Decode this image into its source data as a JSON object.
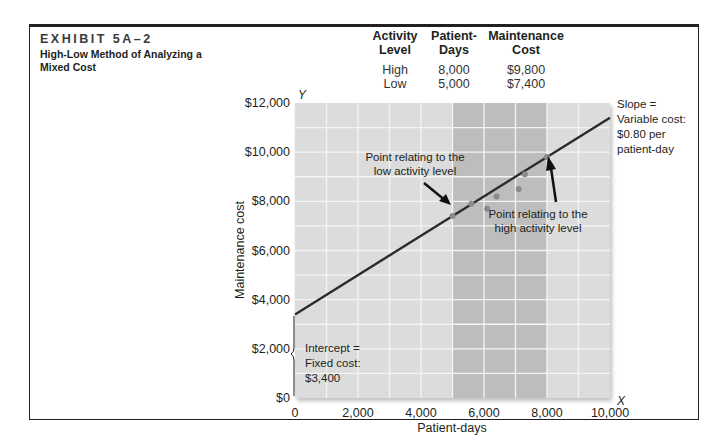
{
  "exhibit": {
    "number": "EXHIBIT 5A–2",
    "title": "High-Low Method of Analyzing a Mixed Cost"
  },
  "table": {
    "headers": [
      {
        "line1": "Activity",
        "line2": "Level"
      },
      {
        "line1": "Patient-",
        "line2": "Days"
      },
      {
        "line1": "Maintenance",
        "line2": "Cost"
      }
    ],
    "rows": [
      {
        "level": "High",
        "days": "8,000",
        "cost": "$9,800"
      },
      {
        "level": "Low",
        "days": "5,000",
        "cost": "$7,400"
      }
    ]
  },
  "annotations": {
    "low_point": "Point relating to the low activity level",
    "low_point_l1": "Point relating to the",
    "low_point_l2": "low activity level",
    "high_point_l1": "Point relating to the",
    "high_point_l2": "high activity level",
    "slope_l1": "Slope =",
    "slope_l2": "Variable cost:",
    "slope_l3": "$0.80 per",
    "slope_l4": "patient-day",
    "intercept_l1": "Intercept =",
    "intercept_l2": "Fixed cost:",
    "intercept_l3": "$3,400"
  },
  "chart_data": {
    "type": "scatter",
    "title": "High-Low Method of Analyzing a Mixed Cost",
    "xlabel": "Patient-days",
    "ylabel": "Maintenance cost",
    "x_axis_letter": "X",
    "y_axis_letter": "Y",
    "xlim": [
      0,
      10000
    ],
    "ylim": [
      0,
      12000
    ],
    "x_ticks": [
      "0",
      "2,000",
      "4,000",
      "6,000",
      "8,000",
      "10,000"
    ],
    "y_ticks": [
      "$0",
      "$2,000",
      "$4,000",
      "$6,000",
      "$8,000",
      "$10,000",
      "$12,000"
    ],
    "grid": true,
    "highlight_band": {
      "x_from": 5000,
      "x_to": 8000
    },
    "series": [
      {
        "name": "Observed maintenance cost",
        "type": "scatter",
        "points": [
          {
            "x": 5000,
            "y": 7400,
            "label": "low"
          },
          {
            "x": 5600,
            "y": 7900
          },
          {
            "x": 6100,
            "y": 7700
          },
          {
            "x": 6400,
            "y": 8200
          },
          {
            "x": 7100,
            "y": 8500
          },
          {
            "x": 7300,
            "y": 9100
          },
          {
            "x": 8000,
            "y": 9800,
            "label": "high"
          }
        ]
      },
      {
        "name": "High-low cost line",
        "type": "line",
        "intercept": 3400,
        "slope": 0.8,
        "points": [
          {
            "x": 0,
            "y": 3400
          },
          {
            "x": 10000,
            "y": 11400
          }
        ]
      }
    ]
  }
}
